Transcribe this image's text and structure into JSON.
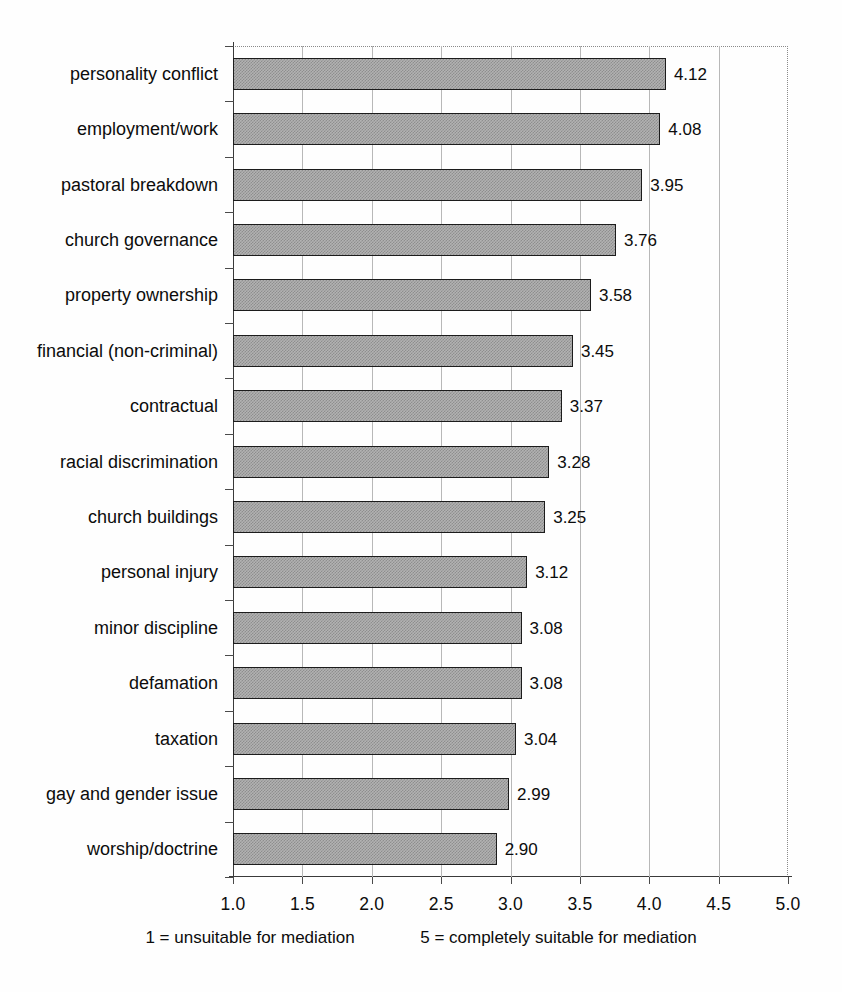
{
  "chart_data": {
    "type": "bar",
    "orientation": "horizontal",
    "title": "",
    "subtitle": "",
    "xlabel": "",
    "ylabel": "",
    "xlim": [
      1.0,
      5.0
    ],
    "xticks": [
      "1.0",
      "1.5",
      "2.0",
      "2.5",
      "3.0",
      "3.5",
      "4.0",
      "4.5",
      "5.0"
    ],
    "xtick_values": [
      1.0,
      1.5,
      2.0,
      2.5,
      3.0,
      3.5,
      4.0,
      4.5,
      5.0
    ],
    "grid": true,
    "grid_axis": "x",
    "legend": null,
    "categories": [
      "personality conflict",
      "employment/work",
      "pastoral breakdown",
      "church governance",
      "property ownership",
      "financial (non-criminal)",
      "contractual",
      "racial discrimination",
      "church buildings",
      "personal injury",
      "minor discipline",
      "defamation",
      "taxation",
      "gay and gender issue",
      "worship/doctrine"
    ],
    "values": [
      4.12,
      4.08,
      3.95,
      3.76,
      3.58,
      3.45,
      3.37,
      3.28,
      3.25,
      3.12,
      3.08,
      3.08,
      3.04,
      2.99,
      2.9
    ],
    "value_labels": [
      "4.12",
      "4.08",
      "3.95",
      "3.76",
      "3.58",
      "3.45",
      "3.37",
      "3.28",
      "3.25",
      "3.12",
      "3.08",
      "3.08",
      "3.04",
      "2.99",
      "2.90"
    ],
    "bar_fill_color": "#b2b2b2",
    "bar_border_color": "#1c1c1c",
    "annotations": {
      "scale_low": "1 = unsuitable for mediation",
      "scale_high": "5 = completely suitable for mediation"
    }
  }
}
